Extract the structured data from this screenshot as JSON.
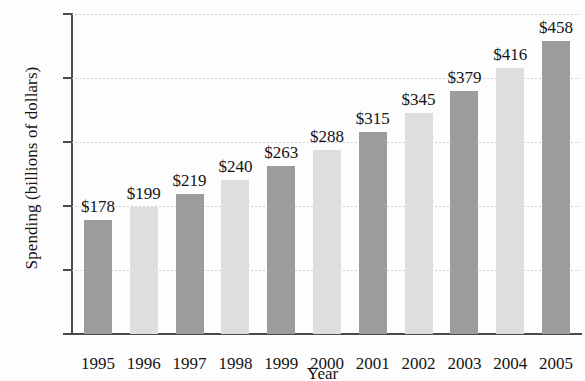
{
  "chart_data": {
    "type": "bar",
    "title": "",
    "xlabel": "Year",
    "ylabel": "Spending (billions of dollars)",
    "categories": [
      "1995",
      "1996",
      "1997",
      "1998",
      "1999",
      "2000",
      "2001",
      "2002",
      "2003",
      "2004",
      "2005"
    ],
    "values": [
      178,
      199,
      219,
      240,
      263,
      288,
      315,
      345,
      379,
      416,
      458
    ],
    "data_labels": [
      "$178",
      "$199",
      "$219",
      "$240",
      "$263",
      "$288",
      "$315",
      "$345",
      "$379",
      "$416",
      "$458"
    ],
    "ylim": [
      0,
      500
    ],
    "yticks": [
      0,
      100,
      200,
      300,
      400,
      500
    ],
    "ytick_labels": [
      "0",
      "100",
      "200",
      "300",
      "400",
      "$500"
    ],
    "grid": true,
    "legend": false,
    "bar_colors": [
      "#9c9c9c",
      "#dedede",
      "#9c9c9c",
      "#dedede",
      "#9c9c9c",
      "#dedede",
      "#9c9c9c",
      "#dedede",
      "#9c9c9c",
      "#dedede",
      "#9c9c9c"
    ],
    "colors": {
      "bar_dark": "#9c9c9c",
      "bar_light": "#dedede",
      "axis": "#4a4a4a",
      "grid": "#c9c9c9",
      "text": "#141414",
      "background": "#fdfdfd"
    }
  }
}
